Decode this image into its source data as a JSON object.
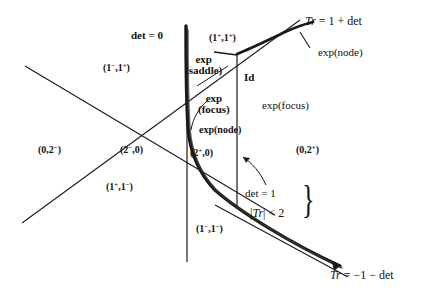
{
  "figure": {
    "kind": "trace-determinant-plane-diagram",
    "background_color": "#ffffff",
    "ink_color": "#111111"
  },
  "curves": {
    "det_zero_line_label": "det = 0",
    "upper_boundary_equation": "Tr = 1 +  det",
    "lower_boundary_equation": "Tr = −1 − det",
    "identity_marker": "Id",
    "det_one_label": "det = 1",
    "trace_bound_label": "|Tr| < 2"
  },
  "region_labels": {
    "upper_left": "(1−,1+)",
    "upper_middle": "(1+,1+)",
    "left": "(0,2−)",
    "center_left": "(2−,0)",
    "center_right": "(2+,0)",
    "lower_left": "(1+,1−)",
    "bottom_center": "(1−,1−)",
    "right": "(0,2+)"
  },
  "region_label_parts": {
    "upper_left": {
      "pre": "(1",
      "sup1": "−",
      "mid": ",1",
      "sup2": "+",
      "post": ")"
    },
    "upper_middle": {
      "pre": "(1",
      "sup1": "+",
      "mid": ",1",
      "sup2": "+",
      "post": ")"
    },
    "left": {
      "pre": "(0,2",
      "sup1": "−",
      "mid": "",
      "sup2": "",
      "post": ")"
    },
    "center_left": {
      "pre": "(2",
      "sup1": "−",
      "mid": ",0",
      "sup2": "",
      "post": ")"
    },
    "center_right": {
      "pre": "(2",
      "sup1": "+",
      "mid": ",0",
      "sup2": "",
      "post": ")"
    },
    "lower_left": {
      "pre": "(1",
      "sup1": "+",
      "mid": ",1",
      "sup2": "−",
      "post": ")"
    },
    "bottom_center": {
      "pre": "(1",
      "sup1": "−",
      "mid": ",1",
      "sup2": "−",
      "post": ")"
    },
    "right": {
      "pre": "(0,2",
      "sup1": "+",
      "mid": "",
      "sup2": "",
      "post": ")"
    }
  },
  "exp_labels": {
    "saddle_line1": "exp",
    "saddle_line2": "(saddle)",
    "focus_line1": "exp",
    "focus_line2": "(focus)",
    "node_small": "exp(node)",
    "node_right": "exp(node)",
    "focus_right": "exp(focus)"
  },
  "equation_text": {
    "top_right_tr": "Tr",
    "top_right_rest": " = 1 +  det",
    "bottom_right_tr": "Tr",
    "bottom_right_rest": " = −1 − det",
    "det_equals_one": "det = 1",
    "abs_tr_open": "|",
    "abs_tr_sym": "Tr",
    "abs_tr_close": "| < 2",
    "brace_glyph": "}"
  }
}
